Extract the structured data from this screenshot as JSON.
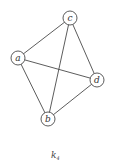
{
  "graph": {
    "nodes": [
      {
        "id": "a",
        "label": "a",
        "x": 18,
        "y": 58
      },
      {
        "id": "b",
        "label": "b",
        "x": 48,
        "y": 119
      },
      {
        "id": "c",
        "label": "c",
        "x": 70,
        "y": 18
      },
      {
        "id": "d",
        "label": "d",
        "x": 97,
        "y": 80
      }
    ],
    "edges": [
      [
        "a",
        "c"
      ],
      [
        "a",
        "d"
      ],
      [
        "a",
        "b"
      ],
      [
        "c",
        "b"
      ],
      [
        "c",
        "d"
      ],
      [
        "b",
        "d"
      ]
    ],
    "node_radius": 7
  },
  "caption": {
    "main": "k",
    "subscript": "4"
  }
}
